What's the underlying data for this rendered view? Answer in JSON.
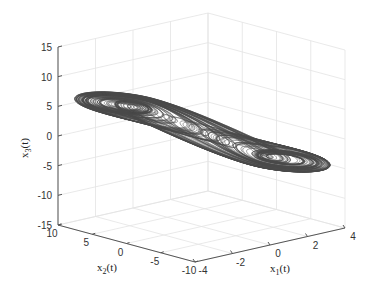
{
  "chart_data": {
    "type": "line3d",
    "title": "",
    "xlabel": "x_1(t)",
    "ylabel": "x_2(t)",
    "zlabel": "x_3(t)",
    "xlabel_main": "x",
    "xlabel_sub": "1",
    "xlabel_tail": "(t)",
    "ylabel_main": "x",
    "ylabel_sub": "2",
    "ylabel_tail": "(t)",
    "zlabel_main": "x",
    "zlabel_sub": "3",
    "zlabel_tail": "(t)",
    "xlim": [
      -4,
      4
    ],
    "ylim": [
      -10,
      10
    ],
    "zlim": [
      -15,
      15
    ],
    "xticks": [
      -4,
      -2,
      0,
      2,
      4
    ],
    "yticks": [
      10,
      5,
      0,
      -5,
      -10
    ],
    "zticks": [
      15,
      10,
      5,
      0,
      -5,
      -10,
      -15
    ],
    "xtick_labels": [
      "-4",
      "-2",
      "0",
      "2",
      "4"
    ],
    "ytick_labels": [
      "10",
      "5",
      "0",
      "-5",
      "-10"
    ],
    "ztick_labels": [
      "15",
      "10",
      "5",
      "0",
      "-5",
      "-10",
      "-15"
    ],
    "grid": true,
    "line_color": "#4a4a4a",
    "grid_color": "#e3e3e3",
    "axis_color": "#555555",
    "attractor": {
      "lobes": [
        {
          "center": [
            -2.6,
            6.5,
            2.0
          ]
        },
        {
          "center": [
            2.6,
            -6.5,
            -2.0
          ]
        }
      ],
      "extent_x1": [
        -3.2,
        3.3
      ],
      "extent_x2": [
        -8,
        8
      ],
      "extent_x3": [
        -6,
        8
      ]
    }
  }
}
